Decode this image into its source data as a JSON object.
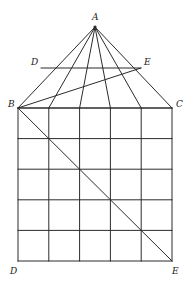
{
  "figure": {
    "kind": "geometry-diagram",
    "width": 191,
    "height": 282,
    "background_color": "#ffffff",
    "stroke_color": "#2b2b2b",
    "label_color": "#1a1a1a"
  },
  "labels": {
    "apex_a": "A",
    "left_d": "D",
    "right_e": "E",
    "left_b": "B",
    "right_c": "C",
    "bottom_left_d": "D",
    "bottom_right_e": "E"
  },
  "chart_data": {
    "type": "scatter",
    "title": "",
    "xlabel": "",
    "ylabel": "",
    "grid": true,
    "points": [
      {
        "name": "A",
        "label": "A",
        "x": 95,
        "y": 27
      },
      {
        "name": "D_upper",
        "label": "D",
        "x": 41,
        "y": 68
      },
      {
        "name": "E_upper",
        "label": "E",
        "x": 141,
        "y": 68
      },
      {
        "name": "B",
        "label": "B",
        "x": 18,
        "y": 108
      },
      {
        "name": "C",
        "label": "C",
        "x": 172,
        "y": 108
      },
      {
        "name": "D_lower",
        "label": "D",
        "x": 18,
        "y": 261
      },
      {
        "name": "E_lower",
        "label": "E",
        "x": 172,
        "y": 261
      }
    ],
    "grid_square": {
      "left": 18,
      "right": 172,
      "top": 108,
      "bottom": 261,
      "columns": 5,
      "rows": 5,
      "x_lines": [
        18,
        48.8,
        79.6,
        110.4,
        141.2,
        172
      ],
      "y_lines": [
        108,
        138.6,
        169.2,
        199.8,
        230.4,
        261
      ]
    },
    "segments": [
      {
        "name": "A-B",
        "from": [
          95,
          27
        ],
        "to": [
          18,
          108
        ]
      },
      {
        "name": "A-C",
        "from": [
          95,
          27
        ],
        "to": [
          172,
          108
        ]
      },
      {
        "name": "A-to-BC-1",
        "from": [
          95,
          27
        ],
        "to": [
          48.8,
          108
        ]
      },
      {
        "name": "A-to-BC-2",
        "from": [
          95,
          27
        ],
        "to": [
          79.6,
          108
        ]
      },
      {
        "name": "A-to-BC-3",
        "from": [
          95,
          27
        ],
        "to": [
          110.4,
          108
        ]
      },
      {
        "name": "A-to-BC-4",
        "from": [
          95,
          27
        ],
        "to": [
          141.2,
          108
        ]
      },
      {
        "name": "D-E-upper",
        "from": [
          41,
          68
        ],
        "to": [
          141,
          68
        ]
      },
      {
        "name": "B-E-upper",
        "from": [
          18,
          108
        ],
        "to": [
          141,
          68
        ]
      },
      {
        "name": "B-C-base",
        "from": [
          18,
          108
        ],
        "to": [
          172,
          108
        ]
      },
      {
        "name": "grid-diagonal-B-to-E",
        "from": [
          18,
          108
        ],
        "to": [
          172,
          261
        ]
      }
    ]
  }
}
